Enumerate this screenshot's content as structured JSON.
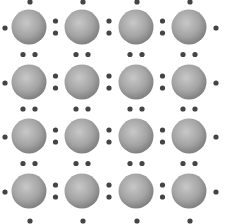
{
  "diagram": {
    "type": "lattice",
    "rows": 4,
    "cols": 4,
    "col_centers": [
      29,
      82,
      136,
      189
    ],
    "row_centers": [
      27,
      82,
      136,
      191
    ],
    "sphere_radius": 17.5,
    "dot_radius": 2.6,
    "colors": {
      "background": "#ffffff",
      "sphere_light": "#c8c8c8",
      "sphere_mid": "#a4a4a4",
      "sphere_dark": "#7c7c7c",
      "dot": "#444444"
    },
    "edge_dots": {
      "top_y": 2,
      "bottom_y": 221,
      "left_x": 5,
      "right_x": 216
    },
    "pair_offset": 6
  }
}
